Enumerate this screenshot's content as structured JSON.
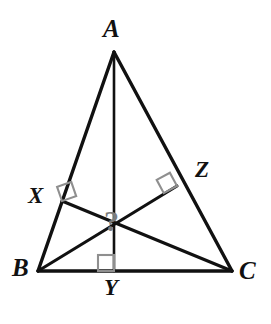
{
  "figure": {
    "kind": "geometry-diagram",
    "background_color": "#ffffff",
    "stroke_color": "#111111",
    "mark_color": "#8f8f8f",
    "query_color": "#7d7d7d",
    "canvas": {
      "width": 271,
      "height": 324
    }
  },
  "labels": {
    "apex": "A",
    "bottom_left": "B",
    "bottom_right": "C",
    "foot_on_ab": "X",
    "foot_on_bc": "Y",
    "foot_on_ac": "Z",
    "unknown_point": "?"
  },
  "points": {
    "A": {
      "x": 114,
      "y": 52
    },
    "B": {
      "x": 38,
      "y": 271
    },
    "C": {
      "x": 232,
      "y": 271
    },
    "X": {
      "x": 62,
      "y": 201
    },
    "Y": {
      "x": 114,
      "y": 271
    },
    "Z": {
      "x": 177,
      "y": 186
    },
    "P": {
      "x": 114,
      "y": 224
    }
  },
  "segments": [
    {
      "name": "side-AB",
      "from": "A",
      "to": "B",
      "style": "solid",
      "width": 3.2
    },
    {
      "name": "side-AC",
      "from": "A",
      "to": "C",
      "style": "solid",
      "width": 3.2
    },
    {
      "name": "side-BC",
      "from": "B",
      "to": "C",
      "style": "solid",
      "width": 3.2
    },
    {
      "name": "cevian-A-to-Y",
      "from": "A",
      "to": "Y",
      "style": "solid",
      "width": 2.6
    },
    {
      "name": "cevian-B-to-Z",
      "from": "B",
      "to": "Z",
      "style": "solid",
      "width": 3.0
    },
    {
      "name": "cevian-C-to-X",
      "from": "C",
      "to": "X",
      "style": "solid",
      "width": 3.0
    }
  ],
  "right_angle_marks": [
    {
      "name": "right-angle-at-X",
      "at": "X",
      "size": 15
    },
    {
      "name": "right-angle-at-Y",
      "at": "Y",
      "size": 16
    },
    {
      "name": "right-angle-at-Z",
      "at": "Z",
      "size": 15
    }
  ]
}
